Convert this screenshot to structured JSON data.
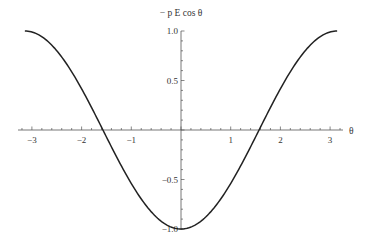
{
  "chart_data": {
    "type": "line",
    "title": "",
    "ylabel": "− p E cos θ",
    "xlabel": "θ",
    "function": "-cos(theta)",
    "xlim": [
      -3.14159,
      3.14159
    ],
    "ylim": [
      -1.0,
      1.0
    ],
    "x_ticks": [
      -3,
      -2,
      -1,
      1,
      2,
      3
    ],
    "x_tick_labels": [
      "−3",
      "−2",
      "−1",
      "1",
      "2",
      "3"
    ],
    "y_ticks": [
      -1.0,
      -0.5,
      0.5,
      1.0
    ],
    "y_tick_labels": [
      "−1.0",
      "−0.5",
      "0.5",
      "1.0"
    ],
    "series": [
      {
        "name": "−p E cos θ",
        "x": [
          -3.14159,
          -2.5,
          -2.0,
          -1.5708,
          -1.0,
          -0.5,
          0,
          0.5,
          1.0,
          1.5708,
          2.0,
          2.5,
          3.14159
        ],
        "values": [
          1.0,
          0.801,
          0.416,
          0.0,
          -0.54,
          -0.878,
          -1.0,
          -0.878,
          -0.54,
          0.0,
          0.416,
          0.801,
          1.0
        ],
        "color": "#222222"
      }
    ],
    "grid": false,
    "legend": "none",
    "axes_origin": [
      0,
      0
    ]
  }
}
